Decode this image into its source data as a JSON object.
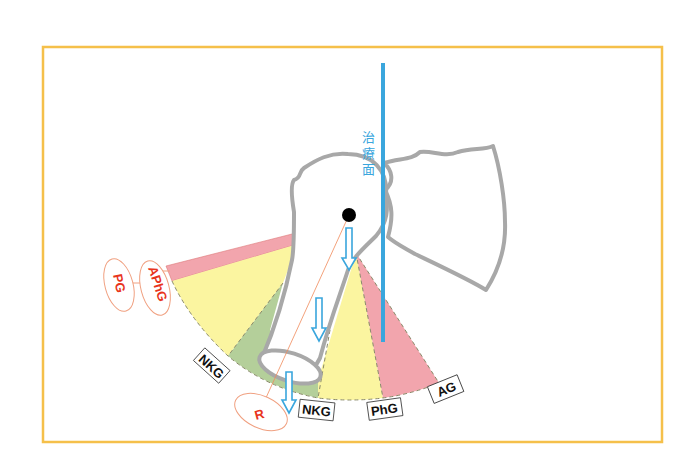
{
  "figure": {
    "type": "anatomical-diagram",
    "frame_color": "#f5c04a",
    "treatment_plane": {
      "label": "治療面",
      "color": "#3aa6dd"
    },
    "sectors": [
      {
        "id": "aphg",
        "color": "#f2a5ad",
        "label": "APhG"
      },
      {
        "id": "yellow-posterior",
        "color": "#fbf5a0"
      },
      {
        "id": "nkg-posterior",
        "color": "#b4cf9a"
      },
      {
        "id": "yellow-anterior",
        "color": "#fbf5a0"
      },
      {
        "id": "ag",
        "color": "#f2a5ad"
      }
    ],
    "labels": {
      "pg": "PG",
      "aphg": "APhG",
      "nkg_left": "NKG",
      "nkg_bottom": "NKG",
      "phg": "PhG",
      "ag": "AG",
      "r": "R"
    },
    "colors": {
      "bone_outline": "#a8a8a8",
      "arrow": "#3aa6dd",
      "red_label": "#e8341c",
      "ellipse_outline": "#f0a080",
      "axis_line": "#f08a5a",
      "pink": "#f2a5ad",
      "yellow": "#fbf5a0",
      "green": "#b4cf9a",
      "dashed_edge": "#8a8a6a"
    }
  }
}
